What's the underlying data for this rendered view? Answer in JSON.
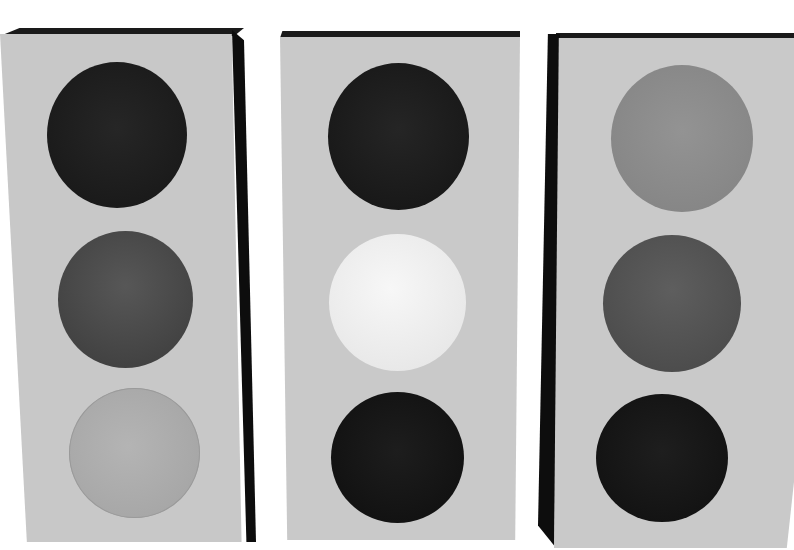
{
  "scene": {
    "description": "Three grayscale traffic light housings, each with three round lamps",
    "background": "#ffffff",
    "housing_color": "#c9c9c9",
    "edge_color": "#111111"
  },
  "traffic_lights": [
    {
      "name": "left",
      "lamps": [
        {
          "position": "top",
          "shade": "#1f1f1f",
          "state": "off"
        },
        {
          "position": "middle",
          "shade": "#4a4a4a",
          "state": "off"
        },
        {
          "position": "bottom",
          "shade": "#ababab",
          "state": "lit"
        }
      ]
    },
    {
      "name": "center",
      "lamps": [
        {
          "position": "top",
          "shade": "#1c1c1c",
          "state": "off"
        },
        {
          "position": "middle",
          "shade": "#eeeeee",
          "state": "lit"
        },
        {
          "position": "bottom",
          "shade": "#141414",
          "state": "off"
        }
      ]
    },
    {
      "name": "right",
      "lamps": [
        {
          "position": "top",
          "shade": "#8a8a8a",
          "state": "lit"
        },
        {
          "position": "middle",
          "shade": "#555555",
          "state": "off"
        },
        {
          "position": "bottom",
          "shade": "#151515",
          "state": "off"
        }
      ]
    }
  ]
}
